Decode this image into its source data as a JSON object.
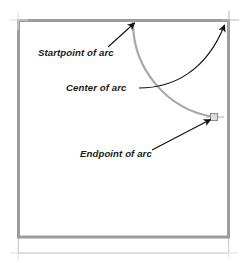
{
  "canvas": {
    "width": 250,
    "height": 263,
    "background": "#ffffff",
    "description": "CAD drawing showing an arc drawn inside a rectangular shape with three callout annotations"
  },
  "colors": {
    "shape_border": "#9c9c9c",
    "shape_border_light": "#c8c8c8",
    "arc_stroke": "#a8a8a8",
    "annotation_stroke": "#1a1a1a",
    "text": "#1a1a1a",
    "grip_fill": "#d8d8d8",
    "grip_stroke": "#8a8a8a"
  },
  "shape": {
    "name": "rectangle-outline",
    "left": 18,
    "top": 20,
    "right": 229,
    "bottom": 237,
    "stroke_width": 3,
    "skirt_bottom": 253
  },
  "arc": {
    "name": "drawn-arc",
    "start": {
      "x": 133,
      "y": 21,
      "label": "Startpoint of arc"
    },
    "center": {
      "x": 229,
      "y": 21,
      "label": "Center of arc"
    },
    "end": {
      "x": 214,
      "y": 117,
      "label": "Endpoint of arc"
    },
    "radius": 96,
    "stroke_width": 2.2
  },
  "markers": [
    {
      "name": "node-marker-top-left",
      "x": 18,
      "y": 20,
      "type": "cross"
    },
    {
      "name": "node-marker-top-right",
      "x": 229,
      "y": 20,
      "type": "cross"
    },
    {
      "name": "node-marker-bottom-left",
      "x": 18,
      "y": 253,
      "type": "cross"
    },
    {
      "name": "grip-marker-endpoint",
      "x": 214,
      "y": 117,
      "type": "square-grip"
    }
  ],
  "annotations": [
    {
      "id": "startpoint",
      "label": "Startpoint of arc",
      "text_x": 38,
      "text_y": 56,
      "leader_from": {
        "x": 108,
        "y": 47
      },
      "leader_to": {
        "x": 133,
        "y": 22
      },
      "arrow": "up-right",
      "leader_type": "straight"
    },
    {
      "id": "center",
      "label": "Center of arc",
      "text_x": 66,
      "text_y": 91,
      "leader_from": {
        "x": 139,
        "y": 88
      },
      "leader_to": {
        "x": 226,
        "y": 23
      },
      "arrow": "up-right",
      "leader_type": "curved"
    },
    {
      "id": "endpoint",
      "label": "Endpoint of arc",
      "text_x": 80,
      "text_y": 157,
      "leader_from": {
        "x": 152,
        "y": 150
      },
      "leader_to": {
        "x": 212,
        "y": 118
      },
      "arrow": "up-right",
      "leader_type": "straight"
    }
  ]
}
